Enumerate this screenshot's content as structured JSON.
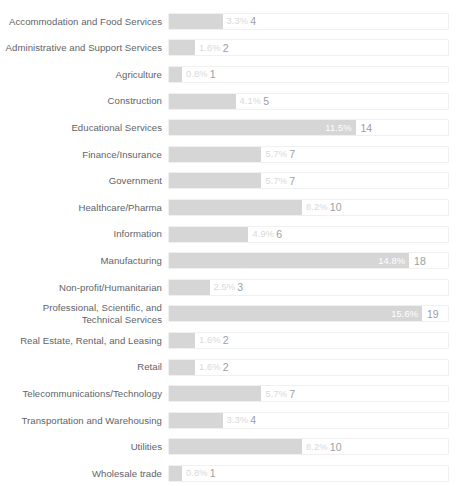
{
  "chart_data": {
    "type": "bar",
    "orientation": "horizontal",
    "title": "",
    "xlabel": "",
    "ylabel": "",
    "grid": false,
    "legend": null,
    "xlim": [
      0,
      17.2
    ],
    "categories": [
      "Accommodation and Food Services",
      "Administrative and Support Services",
      "Agriculture",
      "Construction",
      "Educational Services",
      "Finance/Insurance",
      "Government",
      "Healthcare/Pharma",
      "Information",
      "Manufacturing",
      "Non-profit/Humanitarian",
      "Professional, Scientific, and\nTechnical Services",
      "Real Estate, Rental, and Leasing",
      "Retail",
      "Telecommunications/Technology",
      "Transportation and Warehousing",
      "Utilities",
      "Wholesale trade"
    ],
    "series": [
      {
        "name": "Percent",
        "values": [
          3.3,
          1.6,
          0.8,
          4.1,
          11.5,
          5.7,
          5.7,
          8.2,
          4.9,
          14.8,
          2.5,
          15.6,
          1.6,
          1.6,
          5.7,
          3.3,
          8.2,
          0.8
        ]
      },
      {
        "name": "Count",
        "values": [
          4,
          2,
          1,
          5,
          14,
          7,
          7,
          10,
          6,
          18,
          3,
          19,
          2,
          2,
          7,
          4,
          10,
          1
        ]
      }
    ],
    "percent_labels": [
      "3.3%",
      "1.6%",
      "0.8%",
      "4.1%",
      "11.5%",
      "5.7%",
      "5.7%",
      "8.2%",
      "4.9%",
      "14.8%",
      "2.5%",
      "15.6%",
      "1.6%",
      "1.6%",
      "5.7%",
      "3.3%",
      "8.2%",
      "0.8%"
    ],
    "count_labels": [
      "4",
      "2",
      "1",
      "5",
      "14",
      "7",
      "7",
      "10",
      "6",
      "18",
      "3",
      "19",
      "2",
      "2",
      "7",
      "4",
      "10",
      "1"
    ],
    "colors": {
      "bar_fill": "#d6d6d6",
      "track_background": "#ffffff",
      "track_border": "#f0f0f0",
      "label_text": "#5f6368",
      "percent_text_inside": "#ffffff",
      "percent_text_outside": "#d9d9d9",
      "count_text": "#9aa0a6"
    }
  }
}
